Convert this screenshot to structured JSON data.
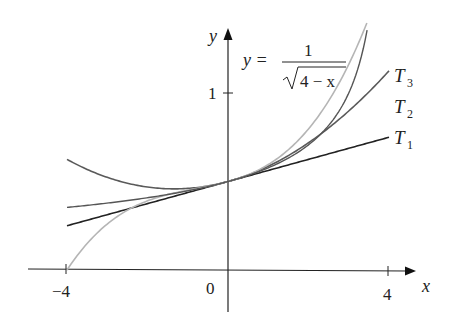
{
  "chart_data": {
    "type": "line",
    "title": "",
    "xlabel": "x",
    "ylabel": "y",
    "xlim": [
      -5,
      5
    ],
    "ylim": [
      -0.2,
      1.4
    ],
    "grid": false,
    "x_ticks": [
      {
        "value": -4,
        "label": "−4"
      },
      {
        "value": 0,
        "label": "0"
      },
      {
        "value": 4,
        "label": "4"
      }
    ],
    "y_ticks": [
      {
        "value": 1,
        "label": "1"
      }
    ],
    "function_label": {
      "lhs": "y =",
      "numerator": "1",
      "denominator": "4 − x"
    },
    "series": [
      {
        "name": "y = 1/√(4−x)",
        "label": "",
        "color": "#555555",
        "domain": [
          -4,
          3.55
        ],
        "formula": "1/sqrt(4-x)"
      },
      {
        "name": "T3",
        "label_main": "T",
        "label_sub": "3",
        "color": "#b5b5b5",
        "domain": [
          -4,
          4
        ],
        "coefficients": [
          0.5,
          0.0625,
          0.0234375,
          0.009765625
        ]
      },
      {
        "name": "T2",
        "label_main": "T",
        "label_sub": "2",
        "color": "#5a5a5a",
        "domain": [
          -4,
          4
        ],
        "coefficients": [
          0.5,
          0.0625,
          0.0234375
        ]
      },
      {
        "name": "T1",
        "label_main": "T",
        "label_sub": "1",
        "color": "#222222",
        "domain": [
          -4,
          4
        ],
        "coefficients": [
          0.5,
          0.0625
        ]
      }
    ]
  }
}
